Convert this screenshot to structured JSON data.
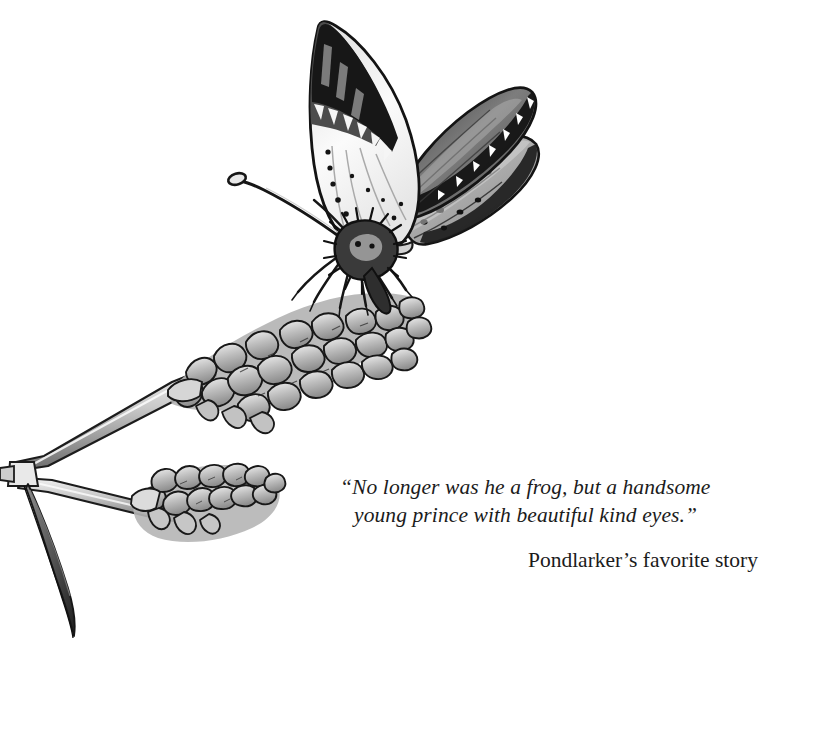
{
  "page": {
    "kind": "storybook-illustration-page",
    "background_color": "#ffffff",
    "width": 830,
    "height": 734
  },
  "illustration": {
    "subject": "butterfly perched on a flowering spike",
    "medium": "pen-and-ink line drawing with grayscale wash",
    "palette": {
      "ink": "#1a1a1a",
      "dark_wash": "#5a5a5a",
      "mid_wash": "#9b9b9b",
      "light_wash": "#c4c4c4",
      "pale_wash": "#e2e2e2",
      "paper": "#ffffff"
    },
    "elements": [
      {
        "name": "butterfly-left-forewing",
        "note": "black tip, pale interior with speckles"
      },
      {
        "name": "butterfly-right-forewing",
        "note": "dark gray wash, scalloped margin"
      },
      {
        "name": "butterfly-right-hindwing",
        "note": "mid gray with dark spot row"
      },
      {
        "name": "butterfly-body",
        "note": "hairy dark thorax and abdomen"
      },
      {
        "name": "butterfly-antenna",
        "note": "long, clubbed tip pointing upper-left"
      },
      {
        "name": "butterfly-legs",
        "note": "six thin legs gripping flower"
      },
      {
        "name": "upper-flower-spike",
        "note": "dense overlapping petals, diagonal"
      },
      {
        "name": "lower-flower-spike",
        "note": "shorter spike, lower left"
      },
      {
        "name": "forked-stem",
        "note": "splits into two branches at left"
      },
      {
        "name": "drooping-leaf",
        "note": "thin curved blade hanging down"
      }
    ]
  },
  "caption": {
    "quote_line_1": "“No longer was he a frog, but a handsome",
    "quote_line_2": "young prince with beautiful kind eyes.”",
    "attribution": "Pondlarker’s favorite story",
    "text_color": "#1b1b1b"
  }
}
